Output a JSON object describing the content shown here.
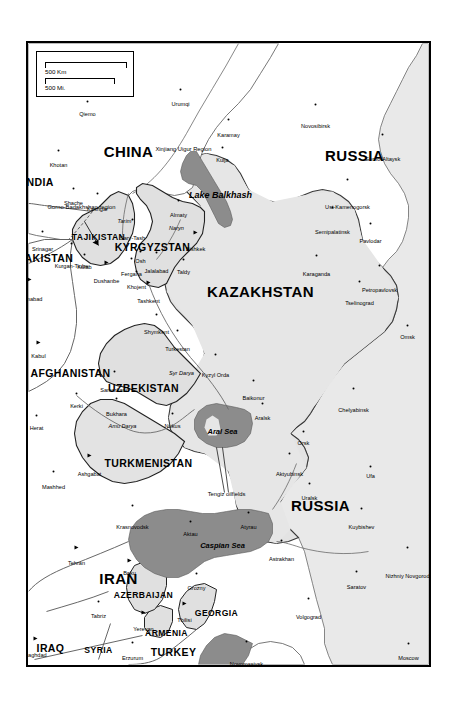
{
  "map": {
    "title": "Central Asia reference map",
    "colors": {
      "land": "#e6e6e6",
      "land_outside": "#ffffff",
      "water": "#8f8f8f",
      "border": "#3a3a3a",
      "frame": "#000000",
      "text": "#000000"
    },
    "scale_bar": {
      "km_label": "500 Km",
      "mi_label": "500 Mi."
    },
    "countries": [
      {
        "name": "RUSSIA",
        "size": "c-xl",
        "x": 112,
        "y": 74
      },
      {
        "name": "RUSSIA",
        "size": "c-xl",
        "x": 462,
        "y": 108
      },
      {
        "name": "KAZAKHSTAN",
        "size": "c-xl",
        "x": 248,
        "y": 168
      },
      {
        "name": "CHINA",
        "size": "c-xl",
        "x": 108,
        "y": 300
      },
      {
        "name": "IRAN",
        "size": "c-xl",
        "x": 535,
        "y": 310
      },
      {
        "name": "UZBEKISTAN",
        "size": "c-md",
        "x": 345,
        "y": 285
      },
      {
        "name": "TURKMENISTAN",
        "size": "c-md",
        "x": 420,
        "y": 280
      },
      {
        "name": "KYRGYZSTAN",
        "size": "c-md",
        "x": 204,
        "y": 276
      },
      {
        "name": "TAJIKISTAN",
        "size": "c-sm",
        "x": 194,
        "y": 330
      },
      {
        "name": "AFGHANISTAN",
        "size": "c-md",
        "x": 330,
        "y": 358
      },
      {
        "name": "PAKISTAN",
        "size": "c-md",
        "x": 215,
        "y": 383
      },
      {
        "name": "INDIA",
        "size": "c-md",
        "x": 139,
        "y": 390
      },
      {
        "name": "TURKEY",
        "size": "c-md",
        "x": 609,
        "y": 255
      },
      {
        "name": "SYRIA",
        "size": "c-sm",
        "x": 607,
        "y": 330
      },
      {
        "name": "IRAQ",
        "size": "c-md",
        "x": 605,
        "y": 378
      },
      {
        "name": "GEORGIA",
        "size": "c-sm",
        "x": 570,
        "y": 212
      },
      {
        "name": "ARMENIA",
        "size": "c-sm",
        "x": 590,
        "y": 262
      },
      {
        "name": "AZERBAIJAN",
        "size": "c-sm",
        "x": 552,
        "y": 285
      },
      {
        "name": "UKRAINE",
        "size": "c-md",
        "x": 633,
        "y": 130
      }
    ],
    "waters": [
      {
        "name": "Lake Balkhash",
        "size": "water",
        "x": 152,
        "y": 208
      },
      {
        "name": "Aral Sea",
        "size": "water-sm",
        "x": 388,
        "y": 206
      },
      {
        "name": "Caspian Sea",
        "size": "water-sm",
        "x": 502,
        "y": 206
      }
    ],
    "rivers": [
      {
        "name": "Syr Darya",
        "x": 330,
        "y": 247
      },
      {
        "name": "Amu Darya",
        "x": 383,
        "y": 306
      },
      {
        "name": "Tarim",
        "x": 178,
        "y": 304
      },
      {
        "name": "Naryn",
        "x": 185,
        "y": 252
      }
    ],
    "regions": [
      {
        "name": "Xinjiang Uigur Region",
        "x": 106,
        "y": 245
      },
      {
        "name": "Gorno-Badakhshan region",
        "x": 164,
        "y": 347
      },
      {
        "name": "Tengiz oilfields",
        "x": 451,
        "y": 202
      }
    ],
    "cities": [
      {
        "name": "Novosibirsk",
        "x": 61,
        "y": 113,
        "capital": false
      },
      {
        "name": "Gorno-Altaysk",
        "x": 91,
        "y": 46,
        "capital": false
      },
      {
        "name": "Ust-Kamenogorsk",
        "x": 136,
        "y": 81,
        "capital": false
      },
      {
        "name": "Semipalatinsk",
        "x": 164,
        "y": 96,
        "capital": false
      },
      {
        "name": "Pavlodar",
        "x": 180,
        "y": 58,
        "capital": false
      },
      {
        "name": "Petropavlovsk",
        "x": 222,
        "y": 49,
        "capital": false
      },
      {
        "name": "Karaganda",
        "x": 212,
        "y": 112,
        "capital": false
      },
      {
        "name": "Tselinograd",
        "x": 238,
        "y": 69,
        "capital": false
      },
      {
        "name": "Karamay",
        "x": 76,
        "y": 200,
        "capital": false
      },
      {
        "name": "Urumqi",
        "x": 46,
        "y": 248,
        "capital": false
      },
      {
        "name": "Kulja",
        "x": 104,
        "y": 206,
        "capital": false
      },
      {
        "name": "Qiemo",
        "x": 58,
        "y": 341,
        "capital": false
      },
      {
        "name": "Khotan",
        "x": 107,
        "y": 370,
        "capital": false
      },
      {
        "name": "Kashgar",
        "x": 150,
        "y": 331,
        "capital": false
      },
      {
        "name": "Shache",
        "x": 145,
        "y": 355,
        "capital": false
      },
      {
        "name": "Almaty",
        "x": 157,
        "y": 250,
        "capital": false
      },
      {
        "name": "Bishkek",
        "x": 190,
        "y": 233,
        "capital": true
      },
      {
        "name": "Jalalabad",
        "x": 209,
        "y": 272,
        "capital": false
      },
      {
        "name": "Sary-Tash",
        "x": 176,
        "y": 296,
        "capital": false
      },
      {
        "name": "Osh",
        "x": 208,
        "y": 288,
        "capital": false
      },
      {
        "name": "Fergana",
        "x": 215,
        "y": 297,
        "capital": false
      },
      {
        "name": "Khojent",
        "x": 228,
        "y": 292,
        "capital": false
      },
      {
        "name": "Tashkent",
        "x": 240,
        "y": 280,
        "capital": true
      },
      {
        "name": "Dushanbe",
        "x": 220,
        "y": 322,
        "capital": true
      },
      {
        "name": "Kulab",
        "x": 211,
        "y": 344,
        "capital": false
      },
      {
        "name": "Kurgan-Tiube",
        "x": 200,
        "y": 357,
        "capital": false
      },
      {
        "name": "Taldy",
        "x": 216,
        "y": 245,
        "capital": false
      },
      {
        "name": "Shymkent",
        "x": 271,
        "y": 272,
        "capital": false
      },
      {
        "name": "Turkestan",
        "x": 287,
        "y": 251,
        "capital": false
      },
      {
        "name": "Kyzyl Orda",
        "x": 311,
        "y": 213,
        "capital": false
      },
      {
        "name": "Baikonur",
        "x": 337,
        "y": 175,
        "capital": false
      },
      {
        "name": "Aralsk",
        "x": 360,
        "y": 166,
        "capital": false
      },
      {
        "name": "Nukus",
        "x": 370,
        "y": 256,
        "capital": false
      },
      {
        "name": "Bukhara",
        "x": 355,
        "y": 312,
        "capital": false
      },
      {
        "name": "Samarkand",
        "x": 328,
        "y": 314,
        "capital": false
      },
      {
        "name": "Kerki",
        "x": 350,
        "y": 352,
        "capital": false
      },
      {
        "name": "Ashgabat",
        "x": 413,
        "y": 339,
        "capital": true
      },
      {
        "name": "Mashhed",
        "x": 428,
        "y": 375,
        "capital": false
      },
      {
        "name": "Herat",
        "x": 372,
        "y": 392,
        "capital": false
      },
      {
        "name": "Kabul",
        "x": 300,
        "y": 390,
        "capital": true
      },
      {
        "name": "Islamabad",
        "x": 237,
        "y": 399,
        "capital": true
      },
      {
        "name": "Srinagar",
        "x": 188,
        "y": 386,
        "capital": false
      },
      {
        "name": "Krasnovodsk",
        "x": 462,
        "y": 296,
        "capital": false
      },
      {
        "name": "Baku",
        "x": 518,
        "y": 299,
        "capital": true
      },
      {
        "name": "Tehran",
        "x": 505,
        "y": 352,
        "capital": true
      },
      {
        "name": "Tabriz",
        "x": 558,
        "y": 330,
        "capital": false
      },
      {
        "name": "Baghdad",
        "x": 596,
        "y": 393,
        "capital": true
      },
      {
        "name": "Yerevan",
        "x": 570,
        "y": 285,
        "capital": true
      },
      {
        "name": "Tbilisi",
        "x": 561,
        "y": 244,
        "capital": true
      },
      {
        "name": "Erzurum",
        "x": 599,
        "y": 296,
        "capital": false
      },
      {
        "name": "Grozny",
        "x": 530,
        "y": 232,
        "capital": false
      },
      {
        "name": "Novorossiysk",
        "x": 598,
        "y": 182,
        "capital": false
      },
      {
        "name": "Astrakhan",
        "x": 497,
        "y": 147,
        "capital": false
      },
      {
        "name": "Atyrau",
        "x": 469,
        "y": 180,
        "capital": false
      },
      {
        "name": "Aktau",
        "x": 478,
        "y": 238,
        "capital": false
      },
      {
        "name": "Rostov",
        "x": 625,
        "y": 146,
        "capital": false
      },
      {
        "name": "Volgograd",
        "x": 555,
        "y": 120,
        "capital": false
      },
      {
        "name": "Saratov",
        "x": 528,
        "y": 72,
        "capital": false
      },
      {
        "name": "Nizhniy Novgorod",
        "x": 504,
        "y": 21,
        "capital": false
      },
      {
        "name": "Moscow",
        "x": 600,
        "y": 20,
        "capital": false
      },
      {
        "name": "Kuybishev",
        "x": 465,
        "y": 67,
        "capital": false
      },
      {
        "name": "Ufa",
        "x": 423,
        "y": 58,
        "capital": false
      },
      {
        "name": "Uralsk",
        "x": 440,
        "y": 119,
        "capital": false
      },
      {
        "name": "Aktyubinsk",
        "x": 410,
        "y": 139,
        "capital": false
      },
      {
        "name": "Orsk",
        "x": 388,
        "y": 125,
        "capital": false
      },
      {
        "name": "Omsk",
        "x": 282,
        "y": 21,
        "capital": false
      },
      {
        "name": "Chelyabinsk",
        "x": 345,
        "y": 75,
        "capital": false
      }
    ]
  }
}
